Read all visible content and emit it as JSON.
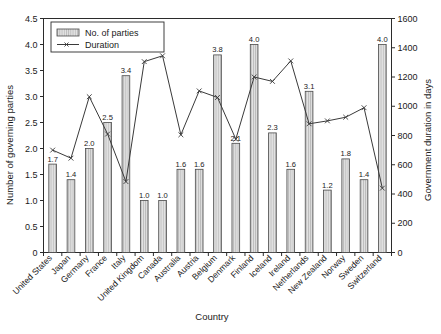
{
  "chart_data": {
    "type": "bar",
    "title": "",
    "subtitle": "",
    "xlabel": "Country",
    "ylabel": "Number of governing parties",
    "y2label": "Government duration in days",
    "ylim": [
      0,
      4.5
    ],
    "y2lim": [
      0,
      1600
    ],
    "yticks": [
      "0",
      "0.5",
      "1.0",
      "1.5",
      "2.0",
      "2.5",
      "3.0",
      "3.5",
      "4.0",
      "4.5"
    ],
    "y2ticks": [
      "0",
      "200",
      "400",
      "600",
      "800",
      "1000",
      "1200",
      "1400",
      "1600"
    ],
    "grid": false,
    "legend_position": "top-left",
    "categories": [
      "United States",
      "Japan",
      "Germany",
      "France",
      "Italy",
      "United Kingdom",
      "Canada",
      "Australia",
      "Austria",
      "Belgium",
      "Denmark",
      "Finland",
      "Iceland",
      "Ireland",
      "Netherlands",
      "New Zealand",
      "Norway",
      "Sweden",
      "Switzerland"
    ],
    "series": [
      {
        "name": "No. of parties",
        "axis": "left",
        "type": "bar",
        "values": [
          1.7,
          1.4,
          2.0,
          2.5,
          3.4,
          1.0,
          1.0,
          1.6,
          1.6,
          3.8,
          2.1,
          4.0,
          2.3,
          1.6,
          3.1,
          1.2,
          1.8,
          1.4,
          4.0
        ],
        "labels": [
          "1.7",
          "1.4",
          "2.0",
          "2.5",
          "3.4",
          "1.0",
          "1.0",
          "1.6",
          "1.6",
          "3.8",
          "2.1",
          "4.0",
          "2.3",
          "1.6",
          "3.1",
          "1.2",
          "1.8",
          "1.4",
          "4.0"
        ]
      },
      {
        "name": "Duration",
        "axis": "right",
        "type": "line",
        "values": [
          700,
          645,
          1065,
          810,
          485,
          1305,
          1345,
          805,
          1105,
          1060,
          775,
          1200,
          1170,
          1310,
          880,
          900,
          925,
          990,
          440
        ]
      }
    ]
  },
  "legend": {
    "items": [
      {
        "label": "No. of parties",
        "marker": "bar-swatch"
      },
      {
        "label": "Duration",
        "marker": "line-swatch"
      }
    ]
  }
}
